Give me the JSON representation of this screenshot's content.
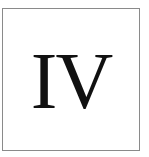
{
  "card": {
    "numeral": "IV",
    "border_color": "#8a8a8a",
    "text_color": "#111111",
    "background": "#ffffff"
  }
}
